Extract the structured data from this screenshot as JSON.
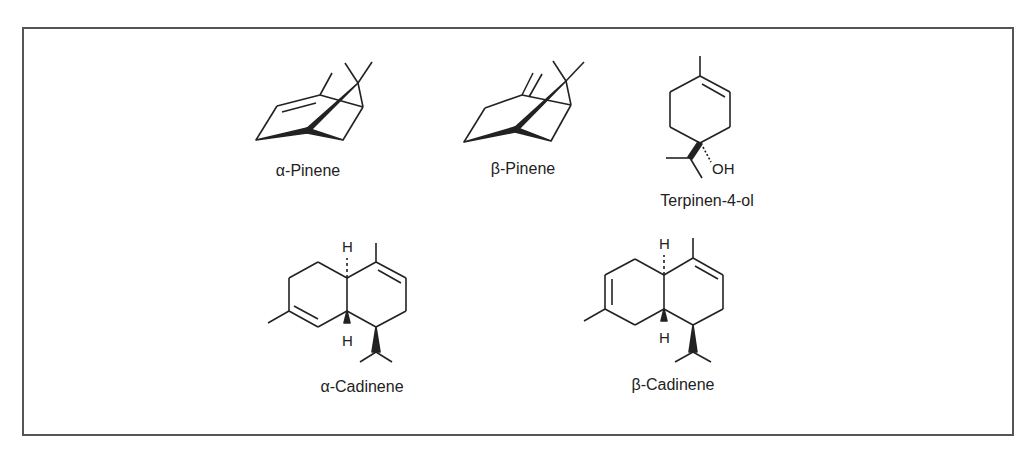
{
  "figure": {
    "type": "chemical-structures",
    "border_color": "#555555",
    "compounds": [
      {
        "id": "alpha-pinene",
        "name": "α-Pinene"
      },
      {
        "id": "beta-pinene",
        "name": "β-Pinene"
      },
      {
        "id": "terpinen-4-ol",
        "name": "Terpinen-4-ol",
        "atoms": {
          "oh": "OH"
        }
      },
      {
        "id": "alpha-cadinene",
        "name": "α-Cadinene",
        "atoms": {
          "h_top": "H",
          "h_bottom": "H"
        }
      },
      {
        "id": "beta-cadinene",
        "name": "β-Cadinene",
        "atoms": {
          "h_top": "H",
          "h_bottom": "H"
        }
      }
    ]
  }
}
